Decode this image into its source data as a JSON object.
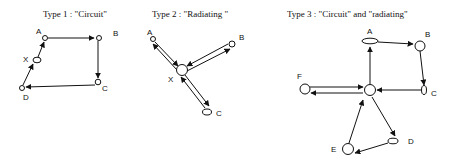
{
  "diagrams": [
    {
      "title": "Type 1 : \"Circuit\"",
      "nodes": {
        "A": "A",
        "B": "B",
        "C": "C",
        "D": "D",
        "X": "X"
      },
      "edges": [
        [
          "A",
          "B"
        ],
        [
          "B",
          "C"
        ],
        [
          "C",
          "D"
        ],
        [
          "D",
          "X"
        ],
        [
          "X",
          "A"
        ]
      ]
    },
    {
      "title": "Type 2 : \"Radiating \"",
      "nodes": {
        "A": "A",
        "B": "B",
        "C": "C",
        "X": "X"
      },
      "edges": [
        [
          "A",
          "X"
        ],
        [
          "X",
          "A"
        ],
        [
          "B",
          "X"
        ],
        [
          "X",
          "B"
        ],
        [
          "C",
          "X"
        ],
        [
          "X",
          "C"
        ]
      ]
    },
    {
      "title": "Type 3 : \"Circuit\" and  \"radiating\"",
      "nodes": {
        "A": "A",
        "B": "B",
        "C": "C",
        "D": "D",
        "E": "E",
        "F": "F"
      },
      "edges": [
        [
          "center",
          "A"
        ],
        [
          "A",
          "B"
        ],
        [
          "B",
          "C"
        ],
        [
          "C",
          "center"
        ],
        [
          "F",
          "center"
        ],
        [
          "center",
          "F"
        ],
        [
          "center",
          "D"
        ],
        [
          "D",
          "E"
        ],
        [
          "E",
          "center"
        ]
      ]
    }
  ]
}
